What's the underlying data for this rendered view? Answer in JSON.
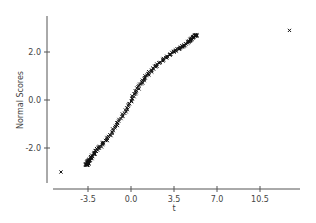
{
  "chart_data": {
    "type": "scatter",
    "title": "",
    "xlabel": "t",
    "ylabel": "Normal Scores",
    "xlim": [
      -6.2,
      15.1
    ],
    "ylim": [
      -3.5,
      3.5
    ],
    "x_ticks": [
      -3.5,
      0.0,
      3.5,
      7.0,
      10.5
    ],
    "x_tick_labels": [
      "-3.5",
      "0.0",
      "3.5",
      "7.0",
      "10.5"
    ],
    "y_ticks": [
      -2.0,
      0.0,
      2.0
    ],
    "y_tick_labels": [
      "-2.0",
      "0.0",
      "2.0"
    ],
    "grid": false,
    "legend": null,
    "marker": "x",
    "curve_anchor_points": [
      {
        "t": -3.6,
        "score": -2.7
      },
      {
        "t": -3.2,
        "score": -2.35
      },
      {
        "t": -2.6,
        "score": -2.0
      },
      {
        "t": -1.9,
        "score": -1.6
      },
      {
        "t": -1.2,
        "score": -1.1
      },
      {
        "t": -0.6,
        "score": -0.6
      },
      {
        "t": -0.1,
        "score": -0.1
      },
      {
        "t": 0.4,
        "score": 0.35
      },
      {
        "t": 0.9,
        "score": 0.75
      },
      {
        "t": 1.4,
        "score": 1.1
      },
      {
        "t": 2.0,
        "score": 1.4
      },
      {
        "t": 2.8,
        "score": 1.75
      },
      {
        "t": 3.6,
        "score": 2.05
      },
      {
        "t": 4.4,
        "score": 2.3
      },
      {
        "t": 5.3,
        "score": 2.7
      }
    ],
    "outliers": [
      {
        "t": -5.7,
        "score": -3.0
      },
      {
        "t": 12.9,
        "score": 2.9
      }
    ],
    "n_points_approx": 200
  }
}
